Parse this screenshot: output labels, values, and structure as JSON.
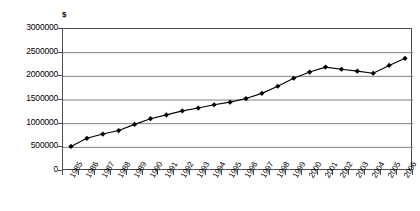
{
  "chart": {
    "y_axis_title": "$",
    "y_tick_labels": [
      "3000000",
      "2500000",
      "2000000",
      "1500000",
      "1000000",
      "500000",
      "0"
    ]
  },
  "chart_data": {
    "type": "line",
    "title": "",
    "subtitle": "",
    "xlabel": "",
    "ylabel": "$",
    "ylim": [
      0,
      3000000
    ],
    "ytick_values": [
      0,
      500000,
      1000000,
      1500000,
      2000000,
      2500000,
      3000000
    ],
    "grid": "horizontal",
    "legend": "none",
    "marker": "filled-diamond",
    "line_color": "#000000",
    "marker_color": "#000000",
    "grid_color": "#808080",
    "axis_color": "#4d4d4d",
    "categories": [
      "1985",
      "1986",
      "1987",
      "1988",
      "1989",
      "1990",
      "1991",
      "1992",
      "1993",
      "1994",
      "1995",
      "1996",
      "1997",
      "1998",
      "1999",
      "2000",
      "2001",
      "2002",
      "2003",
      "2004",
      "2005",
      "2006"
    ],
    "values": [
      520000,
      690000,
      780000,
      855000,
      985000,
      1105000,
      1185000,
      1270000,
      1330000,
      1400000,
      1455000,
      1530000,
      1640000,
      1790000,
      1960000,
      2090000,
      2195000,
      2150000,
      2110000,
      2065000,
      2230000,
      2380000
    ],
    "series": [
      {
        "name": "Series 1",
        "values": [
          520000,
          690000,
          780000,
          855000,
          985000,
          1105000,
          1185000,
          1270000,
          1330000,
          1400000,
          1455000,
          1530000,
          1640000,
          1790000,
          1960000,
          2090000,
          2195000,
          2150000,
          2110000,
          2065000,
          2230000,
          2380000
        ]
      }
    ]
  }
}
